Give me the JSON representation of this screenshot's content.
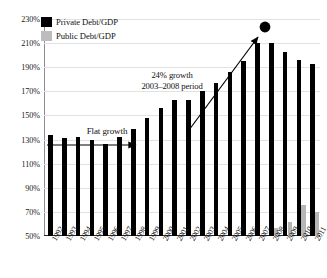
{
  "chart_data": {
    "type": "bar",
    "title": "",
    "xlabel": "",
    "ylabel": "",
    "ylim": [
      50,
      230
    ],
    "ytick_step": 20,
    "ytick_labels": [
      "230%",
      "210%",
      "190%",
      "170%",
      "150%",
      "130%",
      "110%",
      "90%",
      "70%",
      "50%"
    ],
    "ytick_values": [
      230,
      210,
      190,
      170,
      150,
      130,
      110,
      90,
      70,
      50
    ],
    "grid": true,
    "legend_position": "top-left",
    "categories": [
      "1992",
      "1993",
      "1994",
      "1995",
      "1996",
      "1997",
      "1998",
      "1999",
      "2000",
      "2001",
      "2002",
      "2003",
      "2004",
      "2005",
      "2006",
      "2007",
      "2008",
      "2009",
      "2010",
      "2011"
    ],
    "series": [
      {
        "name": "Private Debt/GDP",
        "color": "#000000",
        "values": [
          134,
          131,
          132,
          130,
          126,
          132,
          139,
          148,
          156,
          163,
          163,
          170,
          177,
          186,
          195,
          210,
          210,
          203,
          196,
          193
        ]
      },
      {
        "name": "Public Debt/GDP",
        "color": "#b6b6b6",
        "values": [
          null,
          null,
          null,
          null,
          null,
          null,
          null,
          null,
          null,
          null,
          null,
          null,
          null,
          null,
          null,
          null,
          57,
          62,
          76,
          70
        ]
      }
    ],
    "annotations": [
      {
        "name": "flat-growth",
        "text": "Flat growth",
        "type": "arrow-label",
        "x_from": "1992",
        "x_to": "1998"
      },
      {
        "name": "growth-2003-2008",
        "text_line1": "24% growth",
        "text_line2": "2003–2008 period",
        "type": "arrow-label",
        "x_from": "2003",
        "x_to": "2008",
        "marker": "dot"
      }
    ]
  },
  "legend": {
    "items": [
      {
        "label": "Private Debt/GDP",
        "color": "#000000"
      },
      {
        "label": "Public Debt/GDP",
        "color": "#bdbdbd"
      }
    ]
  },
  "annotations": {
    "flat_growth": "Flat growth",
    "growth_line1": "24% growth",
    "growth_line2": "2003–2008 period"
  }
}
